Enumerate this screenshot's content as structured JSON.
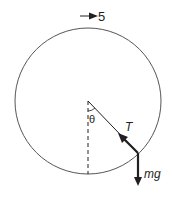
{
  "diagram": {
    "title_arrow_label": "5",
    "angle_label": "θ",
    "tension_label": "T",
    "weight_label": "mg",
    "colors": {
      "stroke": "#231f20",
      "circle": "#555555",
      "background": "#ffffff"
    },
    "elements": [
      "vertical circle path",
      "direction-of-motion arrow at top",
      "pivot at center",
      "dashed vertical reference line",
      "string from center to bob",
      "tension vector toward center",
      "weight vector downward"
    ]
  }
}
